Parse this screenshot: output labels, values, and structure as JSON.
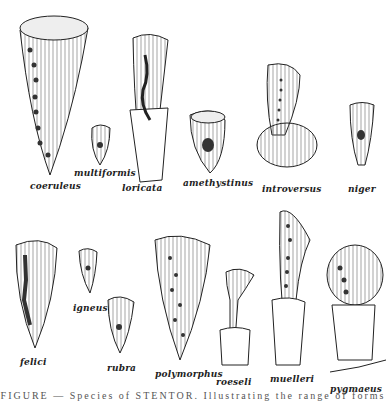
{
  "figure": {
    "subject": "Species of Stentor",
    "caption": "FIGURE — Species of STENTOR. Illustrating the range of forms",
    "labels": {
      "coeruleus": "coeruleus",
      "multiformis": "multiformis",
      "loricata": "loricata",
      "amethystinus": "amethystinus",
      "introversus": "introversus",
      "niger": "niger",
      "felici": "felici",
      "igneus": "igneus",
      "rubra": "rubra",
      "polymorphus": "polymorphus",
      "roeseli": "roeseli",
      "muelleri": "muelleri",
      "pygmaeus": "pygmaeus"
    }
  },
  "colors": {
    "ink": "#222222",
    "paper": "#ffffff",
    "nucleus": "#333333"
  }
}
